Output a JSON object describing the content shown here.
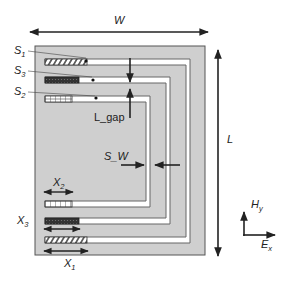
{
  "labels": {
    "width": "W",
    "length": "L",
    "gap": "L_gap",
    "strip_width": "S_W",
    "s1": "S",
    "s1_sub": "1",
    "s2": "S",
    "s2_sub": "2",
    "s3": "S",
    "s3_sub": "3",
    "x1": "X",
    "x1_sub": "1",
    "x2": "X",
    "x2_sub": "2",
    "x3": "X",
    "x3_sub": "3",
    "hy": "H",
    "hy_sub": "y",
    "ex": "E",
    "ex_sub": "x"
  },
  "colors": {
    "substrate": "#cfcfcf",
    "strip": "#ffffff",
    "outline": "#666666",
    "arrow": "#222222"
  }
}
